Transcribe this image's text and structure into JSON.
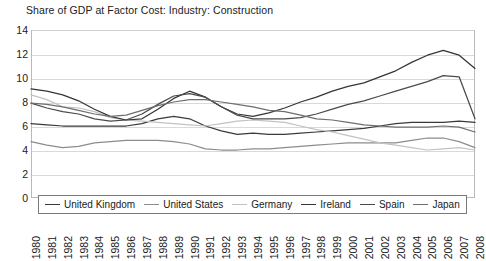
{
  "chart_data": {
    "type": "line",
    "title": "Share of GDP at Factor Cost: Industry: Construction",
    "xlabel": "",
    "ylabel": "",
    "ylim": [
      0,
      14
    ],
    "yticks": [
      0,
      2,
      4,
      6,
      8,
      10,
      12,
      14
    ],
    "ytick_labels": [
      "0",
      "2",
      "4",
      "6",
      "8",
      "10",
      "12",
      "14"
    ],
    "grid": true,
    "legend_position": "bottom-left-inside",
    "x": [
      1980,
      1981,
      1982,
      1983,
      1984,
      1985,
      1986,
      1987,
      1988,
      1989,
      1990,
      1991,
      1992,
      1993,
      1994,
      1995,
      1996,
      1997,
      1998,
      1999,
      2000,
      2001,
      2002,
      2003,
      2004,
      2005,
      2006,
      2007,
      2008
    ],
    "xtick_labels": [
      "1980",
      "1981",
      "1982",
      "1983",
      "1984",
      "1985",
      "1986",
      "1987",
      "1988",
      "1989",
      "1990",
      "1991",
      "1992",
      "1993",
      "1994",
      "1995",
      "1996",
      "1997",
      "1998",
      "1999",
      "2000",
      "2001",
      "2002",
      "2003",
      "2004",
      "2005",
      "2006",
      "2007",
      "2008"
    ],
    "series": [
      {
        "name": "United Kingdom",
        "color": "#3a3a3a",
        "values": [
          6.2,
          6.1,
          6.0,
          6.0,
          6.0,
          6.0,
          6.0,
          6.2,
          6.6,
          6.8,
          6.6,
          6.0,
          5.6,
          5.3,
          5.4,
          5.3,
          5.3,
          5.4,
          5.5,
          5.6,
          5.7,
          5.8,
          6.0,
          6.2,
          6.3,
          6.3,
          6.3,
          6.4,
          6.3
        ]
      },
      {
        "name": "United States",
        "color": "#8c8c8c",
        "values": [
          4.7,
          4.4,
          4.2,
          4.3,
          4.6,
          4.7,
          4.8,
          4.8,
          4.8,
          4.7,
          4.5,
          4.1,
          4.0,
          4.0,
          4.1,
          4.1,
          4.2,
          4.3,
          4.4,
          4.5,
          4.6,
          4.6,
          4.6,
          4.6,
          4.8,
          5.0,
          5.0,
          4.7,
          4.2
        ]
      },
      {
        "name": "Germany",
        "color": "#c2c2c2",
        "values": [
          8.6,
          8.2,
          7.6,
          7.5,
          7.2,
          6.7,
          6.5,
          6.4,
          6.3,
          6.2,
          6.1,
          6.0,
          6.2,
          6.4,
          6.5,
          6.4,
          6.3,
          6.0,
          5.7,
          5.5,
          5.2,
          4.9,
          4.6,
          4.4,
          4.2,
          4.0,
          4.1,
          4.2,
          4.0
        ]
      },
      {
        "name": "Ireland",
        "color": "#353535",
        "values": [
          9.1,
          8.9,
          8.6,
          8.1,
          7.4,
          6.8,
          6.5,
          6.6,
          7.4,
          8.3,
          8.9,
          8.4,
          7.6,
          7.0,
          6.8,
          7.1,
          7.5,
          8.0,
          8.4,
          8.9,
          9.3,
          9.6,
          10.1,
          10.6,
          11.3,
          11.9,
          12.3,
          11.9,
          10.8
        ]
      },
      {
        "name": "Spain",
        "color": "#4a4a4a",
        "values": [
          7.9,
          7.5,
          7.2,
          7.0,
          6.6,
          6.4,
          6.5,
          7.0,
          7.8,
          8.5,
          8.7,
          8.4,
          7.6,
          6.9,
          6.6,
          6.6,
          6.6,
          6.7,
          7.0,
          7.4,
          7.8,
          8.1,
          8.5,
          8.9,
          9.3,
          9.7,
          10.2,
          10.1,
          6.6
        ]
      },
      {
        "name": "Japan",
        "color": "#6e6e6e",
        "values": [
          7.9,
          7.8,
          7.6,
          7.3,
          7.0,
          6.8,
          6.9,
          7.3,
          7.7,
          8.0,
          8.2,
          8.2,
          8.0,
          7.8,
          7.6,
          7.3,
          7.2,
          6.9,
          6.6,
          6.5,
          6.3,
          6.1,
          6.0,
          5.9,
          5.9,
          5.9,
          6.0,
          5.9,
          5.5
        ]
      }
    ]
  },
  "legend": {
    "items": [
      {
        "label": "United Kingdom"
      },
      {
        "label": "United States"
      },
      {
        "label": "Germany"
      },
      {
        "label": "Ireland"
      },
      {
        "label": "Spain"
      },
      {
        "label": "Japan"
      }
    ]
  }
}
